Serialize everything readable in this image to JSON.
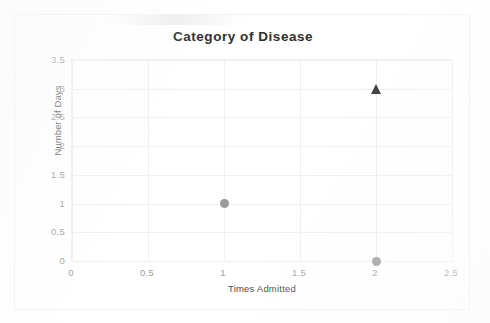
{
  "chart_data": {
    "type": "scatter",
    "title": "Category of Disease",
    "xlabel": "Times Admitted",
    "ylabel": "Number of Days",
    "xlim": [
      0,
      2.5
    ],
    "ylim": [
      0,
      3.5
    ],
    "xticks": [
      "0",
      "0.5",
      "1",
      "1.5",
      "2",
      "2.5"
    ],
    "xtick_values": [
      0,
      0.5,
      1,
      1.5,
      2,
      2.5
    ],
    "yticks": [
      "3.5",
      "3",
      "2.5",
      "2",
      "1.5",
      "1",
      "0.5",
      "0"
    ],
    "ytick_values": [
      3.5,
      3,
      2.5,
      2,
      1.5,
      1,
      0.5,
      0
    ],
    "grid": true,
    "legend": false,
    "series": [
      {
        "name": "series-1",
        "marker": "circle",
        "color": "#9a9a9a",
        "points": [
          {
            "x": 1,
            "y": 1
          },
          {
            "x": 2,
            "y": 0
          }
        ]
      },
      {
        "name": "series-2",
        "marker": "triangle",
        "color": "#3b3b3b",
        "points": [
          {
            "x": 2,
            "y": 3
          }
        ]
      }
    ]
  },
  "colors": {
    "title": "#2f2f2f",
    "tick": "#9b9b9b",
    "axis_title": "#4a4a4a",
    "gridline": "#efefef",
    "frame": "#f1f1f1",
    "marker_circle": "#9a9a9a",
    "marker_triangle": "#3b3b3b"
  }
}
